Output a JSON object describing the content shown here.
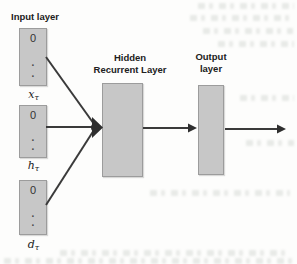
{
  "diagram": {
    "input_section": {
      "title": "Input layer",
      "boxes": [
        {
          "value": "0",
          "dot1": ".",
          "dot2": ".",
          "label_base": "x",
          "label_sub": "τ"
        },
        {
          "value": "0",
          "dot1": ".",
          "dot2": ".",
          "label_base": "h",
          "label_sub": "τ"
        },
        {
          "value": "0",
          "dot1": ".",
          "dot2": ".",
          "label_base": "d",
          "label_sub": "τ"
        }
      ]
    },
    "hidden_section": {
      "title_line1": "Hidden",
      "title_line2": "Recurrent Layer"
    },
    "output_section": {
      "title_line1": "Output",
      "title_line2": "layer"
    },
    "colors": {
      "box_fill": "#c7c7c7",
      "box_border": "#9c9c9c",
      "arrow": "#3a3a3a",
      "text": "#212121"
    }
  }
}
